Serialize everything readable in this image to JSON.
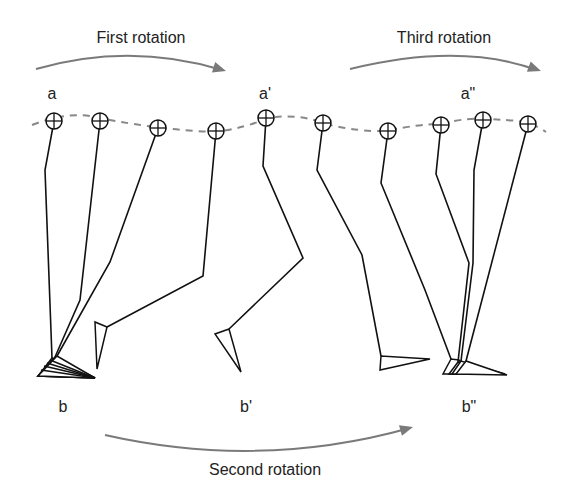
{
  "diagram": {
    "type": "gait-rocker-diagram",
    "rotations": [
      {
        "id": "first",
        "label": "First rotation",
        "label_x": 141,
        "label_y": 43,
        "arc": "M36,69 Q130,42 222,70",
        "arrow_tip": [
          226,
          71
        ]
      },
      {
        "id": "second",
        "label": "Second rotation",
        "label_x": 265,
        "label_y": 475,
        "arc": "M105,435 Q260,470 410,428",
        "arrow_tip": [
          413,
          427
        ]
      },
      {
        "id": "third",
        "label": "Third rotation",
        "label_x": 444,
        "label_y": 43,
        "arc": "M350,69 Q460,42 537,70",
        "arrow_tip": [
          541,
          71
        ]
      }
    ],
    "point_labels": [
      {
        "id": "a",
        "text": "a",
        "x": 52,
        "y": 99
      },
      {
        "id": "a-prime",
        "text": "a'",
        "x": 265,
        "y": 99
      },
      {
        "id": "a-double-prime",
        "text": "a\"",
        "x": 468,
        "y": 99
      },
      {
        "id": "b",
        "text": "b",
        "x": 63,
        "y": 412
      },
      {
        "id": "b-prime",
        "text": "b'",
        "x": 246,
        "y": 412
      },
      {
        "id": "b-double-prime",
        "text": "b\"",
        "x": 469,
        "y": 412
      }
    ],
    "hip_trajectory": "M32,125 Q70,110 100,118 Q160,130 215,132 Q245,128 268,118 Q300,113 325,124 Q360,132 385,131 Q420,124 440,124 Q470,117 485,119 Q510,120 528,122 Q540,128 546,132",
    "legs": [
      {
        "hip": [
          54,
          121
        ],
        "knee": [
          45,
          170
        ],
        "ankle": [
          52,
          358
        ],
        "foot": "M52,358 L38,376 L95,378 Z"
      },
      {
        "hip": [
          100,
          121
        ],
        "knee": [
          80,
          300
        ],
        "ankle": [
          55,
          357
        ],
        "foot": "M55,357 L38,376 L95,378 Z"
      },
      {
        "hip": [
          158,
          128
        ],
        "knee": [
          110,
          262
        ],
        "ankle": [
          57,
          356
        ],
        "foot": "M57,356 L38,376 L95,378 Z"
      },
      {
        "hip": [
          216,
          131
        ],
        "knee": [
          203,
          276
        ],
        "ankle": [
          107,
          327
        ],
        "foot": "M107,327 L95,322 L97,369 Z"
      },
      {
        "hip": [
          266,
          118
        ],
        "knee": [
          263,
          166
        ],
        "ankle": [
          303,
          258
        ],
        "knee2": [
          303,
          258
        ],
        "lower": [
          229,
          329
        ],
        "foot": "M229,329 L215,334 L241,372 Z"
      },
      {
        "hip": [
          323,
          123
        ],
        "knee": [
          317,
          170
        ],
        "ankle": [
          362,
          255
        ],
        "knee2": [
          362,
          255
        ],
        "lower": [
          381,
          356
        ],
        "foot": "M381,356 L380,370 L430,359 Z"
      },
      {
        "hip": [
          388,
          131
        ],
        "knee": [
          381,
          183
        ],
        "ankle": [
          425,
          290
        ],
        "knee2": [
          425,
          290
        ],
        "lower": [
          451,
          359
        ],
        "foot": "M451,359 L443,374 L470,374 L459,360 Z"
      },
      {
        "hip": [
          441,
          125
        ],
        "knee": [
          436,
          174
        ],
        "ankle": [
          469,
          263
        ],
        "knee2": [
          469,
          263
        ],
        "lower": [
          458,
          362
        ],
        "foot": "M458,362 L449,374 L500,374 Z"
      },
      {
        "hip": [
          483,
          120
        ],
        "knee": [
          474,
          170
        ],
        "ankle": [
          473,
          263
        ],
        "knee2": [
          473,
          263
        ],
        "lower": [
          461,
          361
        ],
        "foot": "M461,361 L452,374 L505,374 Z"
      },
      {
        "hip": [
          528,
          124
        ],
        "knee": [
          528,
          124
        ],
        "ankle": [
          466,
          361
        ],
        "knee2": [
          466,
          361
        ],
        "lower": [
          466,
          361
        ],
        "foot": "M466,361 L456,374 L507,375 Z"
      }
    ]
  }
}
